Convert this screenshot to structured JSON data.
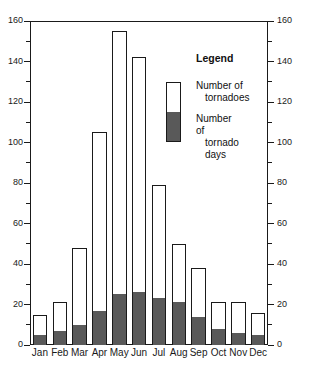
{
  "chart_data": {
    "type": "bar",
    "title": "",
    "subtitle": "",
    "xlabel": "",
    "ylabel": "",
    "ylim": [
      0,
      160
    ],
    "grid": false,
    "stacked": true,
    "categories": [
      "Jan",
      "Feb",
      "Mar",
      "Apr",
      "May",
      "Jun",
      "Jul",
      "Aug",
      "Sep",
      "Oct",
      "Nov",
      "Dec"
    ],
    "y_ticks_major": [
      0,
      20,
      40,
      60,
      80,
      100,
      120,
      140,
      160
    ],
    "y_ticks_minor": [
      10,
      30,
      50,
      70,
      90,
      110,
      130,
      150
    ],
    "left_axis_labels": [
      "0",
      "20",
      "40",
      "60",
      "80",
      "100",
      "120",
      "140",
      "160"
    ],
    "right_axis_labels": [
      "0",
      "20",
      "40",
      "60",
      "80",
      "100",
      "120",
      "140",
      "160"
    ],
    "series": [
      {
        "name": "Number of tornadoes",
        "color": "#ffffff",
        "values": [
          15,
          21,
          48,
          105,
          155,
          142,
          79,
          50,
          38,
          21,
          21,
          16
        ]
      },
      {
        "name": "Number of tornado days",
        "color": "#595959",
        "values": [
          5,
          7,
          10,
          17,
          25,
          26,
          23,
          21,
          14,
          8,
          6,
          5
        ]
      }
    ],
    "legend": {
      "title": "Legend",
      "position": "inside-top-right",
      "entries": [
        {
          "line1": "Number of",
          "line2": "tornadoes"
        },
        {
          "line1": "Number of",
          "line2": "tornado days"
        }
      ]
    }
  }
}
